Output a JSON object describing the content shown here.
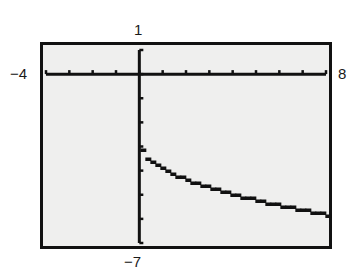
{
  "chart_data": {
    "type": "line",
    "title": "",
    "xlabel": "",
    "ylabel": "",
    "xlim": [
      -4,
      8
    ],
    "ylim": [
      -7,
      1
    ],
    "xscale": 1,
    "yscale": 1,
    "grid": false,
    "window_labels": {
      "xmin": "−4",
      "xmax": "8",
      "ymin": "−7",
      "ymax": "1"
    },
    "series": [
      {
        "name": "y = -3 - sqrt(x)",
        "x": [
          0,
          0.5,
          1,
          1.5,
          2,
          2.5,
          3,
          3.5,
          4,
          4.5,
          5,
          5.5,
          6,
          6.5,
          7,
          7.5,
          8
        ],
        "y": [
          -3.0,
          -3.71,
          -4.0,
          -4.22,
          -4.41,
          -4.58,
          -4.73,
          -4.87,
          -5.0,
          -5.12,
          -5.24,
          -5.35,
          -5.45,
          -5.55,
          -5.65,
          -5.74,
          -5.83
        ]
      }
    ]
  },
  "colors": {
    "screen_bg": "#efefee",
    "ink": "#111111"
  }
}
